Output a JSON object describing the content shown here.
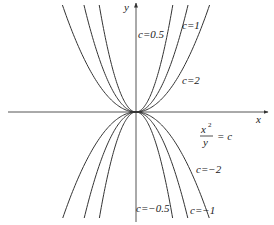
{
  "diagram": {
    "axes": {
      "x_label": "x",
      "y_label": "y",
      "origin_px": [
        136,
        112
      ],
      "x_range_px": [
        8,
        268
      ],
      "y_range_px": [
        3,
        222
      ]
    },
    "equation": {
      "numerator": "x",
      "exponent": "2",
      "denominator": "y",
      "rhs": "= c"
    },
    "scale_px": 25.3,
    "curves": [
      {
        "c": 0.5,
        "label": "c=0.5",
        "show_label": true
      },
      {
        "c": 1,
        "label": "c=1",
        "show_label": true
      },
      {
        "c": 2,
        "label": "c=2",
        "show_label": true
      },
      {
        "c": -0.5,
        "label": "c=−0.5",
        "show_label": true
      },
      {
        "c": -1,
        "label": "c=−1",
        "show_label": true
      },
      {
        "c": -2,
        "label": "c=−2",
        "show_label": true
      }
    ],
    "labels": {
      "c_pos_05": "c=0.5",
      "c_pos_1": "c=1",
      "c_pos_2": "c=2",
      "c_neg_05": "c=−0.5",
      "c_neg_1": "c=−1",
      "c_neg_2": "c=−2"
    },
    "colors": {
      "curve": "#333333",
      "axis": "#555555",
      "text": "#222222"
    }
  }
}
